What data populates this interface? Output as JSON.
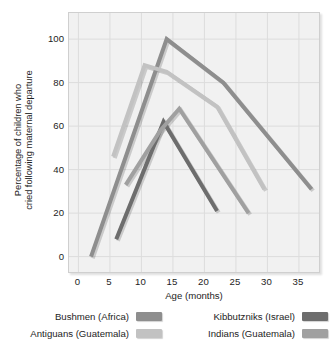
{
  "chart_data": {
    "type": "line",
    "title": "",
    "xlabel": "Age (months)",
    "ylabel": "Percentage of children who cried following maternal departure",
    "ylabel_lines": [
      "Percentage of children who",
      "cried following maternal departure"
    ],
    "xlim": [
      -1.5,
      38.5
    ],
    "ylim": [
      -8,
      112
    ],
    "xticks": [
      0,
      5,
      10,
      15,
      20,
      25,
      30,
      35
    ],
    "xticklabels": [
      "0",
      "5",
      "10",
      "15",
      "20",
      "25",
      "30",
      "35"
    ],
    "yticks": [
      0,
      20,
      40,
      60,
      80,
      100
    ],
    "yticklabels": [
      "0",
      "20",
      "40",
      "60",
      "80",
      "100"
    ],
    "grid": true,
    "grid_color": "#dcdcdc",
    "plot_background": "#f1f1f1",
    "legend_position": "below",
    "series": [
      {
        "name": "Bushmen (Africa)",
        "color": "#8e8e8e",
        "x": [
          2,
          14,
          23,
          37
        ],
        "y": [
          0,
          100,
          80,
          31
        ]
      },
      {
        "name": "Antiguans (Guatemala)",
        "color": "#c2c2c2",
        "x": [
          5.5,
          10.5,
          14,
          22,
          29.5
        ],
        "y": [
          46,
          88,
          85,
          69,
          31
        ]
      },
      {
        "name": "Kibbutzniks (Israel)",
        "color": "#6d6d6d",
        "x": [
          6,
          13.5,
          22
        ],
        "y": [
          8,
          62,
          21
        ]
      },
      {
        "name": "Indians (Guatemala)",
        "color": "#a0a0a0",
        "x": [
          7.5,
          13,
          16,
          27
        ],
        "y": [
          33,
          58,
          68,
          20
        ]
      }
    ]
  },
  "legend": {
    "entries": [
      {
        "label": "Bushmen (Africa)",
        "color": "#8e8e8e"
      },
      {
        "label": "Antiguans (Guatemala)",
        "color": "#c2c2c2"
      },
      {
        "label": "Kibbutzniks (Israel)",
        "color": "#6d6d6d"
      },
      {
        "label": "Indians (Guatemala)",
        "color": "#a0a0a0"
      }
    ]
  }
}
